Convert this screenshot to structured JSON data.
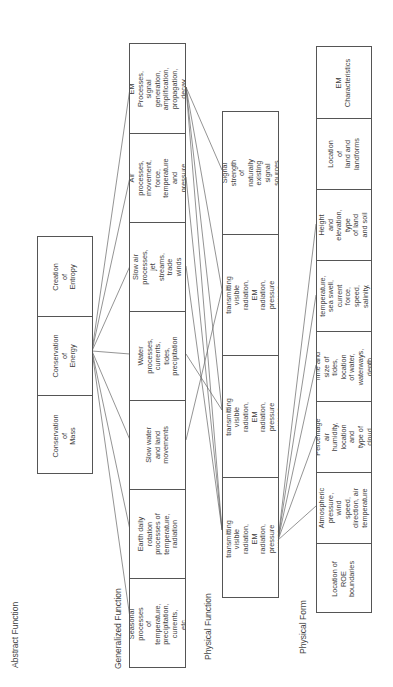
{
  "levels": {
    "abstract_function": {
      "label": "Abstract Function",
      "cells": [
        "Creation of\nEntropy",
        "Conservation of\nEnergy",
        "Conservation of\nMass"
      ]
    },
    "generalized_function": {
      "label": "Generalized Function",
      "cells": [
        "EM Processes,\nsignal generation,\namplification,\npropagation, decay",
        "Air processes,\nmovement, force,\ntemperature and\npressure",
        "Slow air processes,\njet streams, trade\nwinds",
        "Water processes,\ncurrents, tides,\nprecipitation",
        "Slow water and land\nmovements",
        "Earth daily rotation\nprocesses of\ntemperature,\nradiation",
        "Seasonal processes\nof temperature,\nprecipitation,\ncurrents, etc."
      ]
    },
    "physical_function": {
      "label": "Physical Function",
      "cells": [
        "Signal strength\nof naturally\nexisting signal\nsources",
        "Land\nCapability of transmitting\nvisible radiation, EM\nradiation, pressure waves,\nimpeding locomotion",
        "Water\nCapability of transmitting\nvisible radiation, EM\nradiation, pressure waves,\nimpeding locomotion",
        "Air\nCapability of transmitting\nvisible radiation, EM\nradiation, pressure waves,\nimpeding locomotion"
      ]
    },
    "physical_form": {
      "label": "Physical Form",
      "cells": [
        "EM\nCharacteristics",
        "Location of\nland and\nlandforms",
        "Height and\nelevation, type\nof land and soil",
        "Water\ntemperature,\nsea swell,\ncurrent force,\nspeed, salinity,\npressure",
        "Time and size of\ntides, location\nof water,\nwaterways, depth",
        "Percentage air\nhumidity,\nlocation and\ntype of cloud",
        "Atmospheric\npressure, wind\nspeed,\ndirection, air\ntemperature",
        "Location of\nROE\nboundaries"
      ]
    }
  }
}
